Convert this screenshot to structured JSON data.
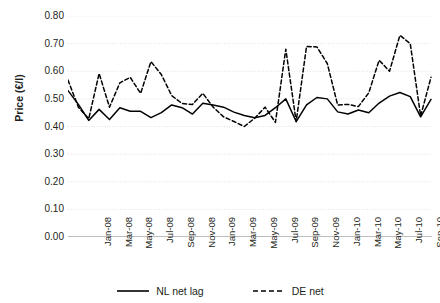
{
  "chart_data": {
    "type": "line",
    "title": "",
    "xlabel": "",
    "ylabel": "Price (€/l)",
    "ylim": [
      0.0,
      0.8
    ],
    "ytick_labels": [
      "0.80",
      "0.70",
      "0.60",
      "0.50",
      "0.40",
      "0.30",
      "0.20",
      "0.10",
      "0.00"
    ],
    "ytick_values": [
      0.8,
      0.7,
      0.6,
      0.5,
      0.4,
      0.3,
      0.2,
      0.1,
      0.0
    ],
    "grid": true,
    "legend_position": "bottom",
    "x": [
      "Jan-08",
      "Feb-08",
      "Mar-08",
      "Apr-08",
      "May-08",
      "Jun-08",
      "Jul-08",
      "Aug-08",
      "Sep-08",
      "Oct-08",
      "Nov-08",
      "Dec-08",
      "Jan-09",
      "Feb-09",
      "Mar-09",
      "Apr-09",
      "May-09",
      "Jun-09",
      "Jul-09",
      "Aug-09",
      "Sep-09",
      "Oct-09",
      "Nov-09",
      "Dec-09",
      "Jan-10",
      "Feb-10",
      "Mar-10",
      "Apr-10",
      "May-10",
      "Jun-10",
      "Jul-10",
      "Aug-10",
      "Sep-10",
      "Oct-10",
      "Nov-10",
      "Dec-10"
    ],
    "xtick_labels": [
      "Jan-08",
      "Mar-08",
      "May-08",
      "Jul-08",
      "Sep-08",
      "Nov-08",
      "Jan-09",
      "Mar-09",
      "May-09",
      "Jul-09",
      "Sep-09",
      "Nov-09",
      "Jan-10",
      "Mar-10",
      "May-10",
      "Jul-10",
      "Sep-10",
      "Nov-10"
    ],
    "xtick_indices": [
      0,
      2,
      4,
      6,
      8,
      10,
      12,
      14,
      16,
      18,
      20,
      22,
      24,
      26,
      28,
      30,
      32,
      34
    ],
    "series": [
      {
        "name": "NL net lag",
        "style": "solid",
        "color": "#000000",
        "values": [
          0.53,
          0.48,
          0.422,
          0.462,
          0.425,
          0.468,
          0.455,
          0.455,
          0.432,
          0.45,
          0.478,
          0.468,
          0.445,
          0.484,
          0.478,
          0.47,
          0.452,
          0.44,
          0.432,
          0.44,
          0.468,
          0.5,
          0.418,
          0.478,
          0.505,
          0.5,
          0.453,
          0.445,
          0.46,
          0.45,
          0.485,
          0.51,
          0.523,
          0.508,
          0.435,
          0.498
        ]
      },
      {
        "name": "DE net",
        "style": "dashed",
        "color": "#000000",
        "values": [
          0.568,
          0.47,
          0.428,
          0.592,
          0.47,
          0.558,
          0.578,
          0.52,
          0.635,
          0.588,
          0.512,
          0.483,
          0.48,
          0.52,
          0.47,
          0.435,
          0.418,
          0.4,
          0.43,
          0.47,
          0.415,
          0.68,
          0.418,
          0.69,
          0.688,
          0.628,
          0.478,
          0.48,
          0.472,
          0.522,
          0.64,
          0.6,
          0.73,
          0.7,
          0.438,
          0.578
        ]
      }
    ]
  },
  "legend": {
    "items": [
      {
        "label": "NL net lag",
        "style": "solid"
      },
      {
        "label": "DE net",
        "style": "dashed"
      }
    ]
  }
}
